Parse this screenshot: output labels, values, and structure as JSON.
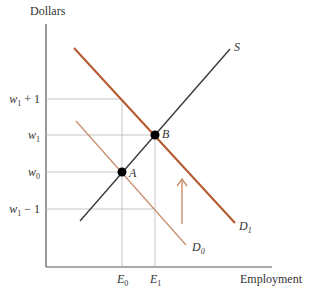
{
  "axes": {
    "y_label": "Dollars",
    "x_label": "Employment"
  },
  "y_ticks": [
    {
      "base": "w",
      "sub": "1",
      "suffix": " + 1",
      "y": 99
    },
    {
      "base": "w",
      "sub": "1",
      "suffix": "",
      "y": 135
    },
    {
      "base": "w",
      "sub": "0",
      "suffix": "",
      "y": 172
    },
    {
      "base": "w",
      "sub": "1",
      "suffix": " − 1",
      "y": 209
    }
  ],
  "x_ticks": [
    {
      "base": "E",
      "sub": "0",
      "x": 122
    },
    {
      "base": "E",
      "sub": "1",
      "x": 155
    }
  ],
  "curves": {
    "supply": {
      "label": "S",
      "color": "#3a3a3a"
    },
    "demand_initial": {
      "label_base": "D",
      "label_sub": "0",
      "color": "#c9906f"
    },
    "demand_new": {
      "label_base": "D",
      "label_sub": "1",
      "color": "#b4582c"
    }
  },
  "points": {
    "A": {
      "label": "A"
    },
    "B": {
      "label": "B"
    }
  },
  "colors": {
    "grid": "#b8b8b8",
    "axis": "#555555",
    "arrow": "#c8916c"
  }
}
